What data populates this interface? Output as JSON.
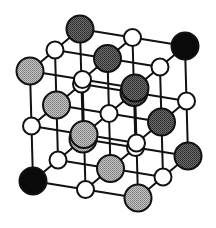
{
  "diagram": {
    "type": "crystal-lattice",
    "lattice": {
      "origin": [
        33,
        181
      ],
      "i_step": [
        52.5,
        8.5
      ],
      "j_step": [
        -1.5,
        -55
      ],
      "k_step": [
        25,
        -21
      ]
    },
    "radii": {
      "large": 13.5,
      "small": 8.5
    },
    "colors": {
      "line": "#111111",
      "black": "#0a0a0a",
      "dark": "#555555",
      "light": "#a9a9a9",
      "white": "#ffffff"
    },
    "large_atoms": [
      {
        "ijk": [
          0,
          0,
          0
        ],
        "fill": "black"
      },
      {
        "ijk": [
          2,
          2,
          2
        ],
        "fill": "black"
      },
      {
        "ijk": [
          0,
          2,
          2
        ],
        "fill": "dark"
      },
      {
        "ijk": [
          1,
          2,
          1
        ],
        "fill": "dark"
      },
      {
        "ijk": [
          2,
          2,
          0
        ],
        "fill": "dark"
      },
      {
        "ijk": [
          1,
          1,
          2
        ],
        "fill": "dark"
      },
      {
        "ijk": [
          2,
          1,
          1
        ],
        "fill": "dark"
      },
      {
        "ijk": [
          2,
          0,
          2
        ],
        "fill": "dark"
      },
      {
        "ijk": [
          0,
          2,
          0
        ],
        "fill": "light"
      },
      {
        "ijk": [
          0,
          1,
          1
        ],
        "fill": "light"
      },
      {
        "ijk": [
          0,
          0,
          2
        ],
        "fill": "light"
      },
      {
        "ijk": [
          1,
          1,
          0
        ],
        "fill": "light"
      },
      {
        "ijk": [
          1,
          0,
          1
        ],
        "fill": "light"
      },
      {
        "ijk": [
          2,
          0,
          0
        ],
        "fill": "light"
      }
    ],
    "small_atoms_fill": "white"
  }
}
